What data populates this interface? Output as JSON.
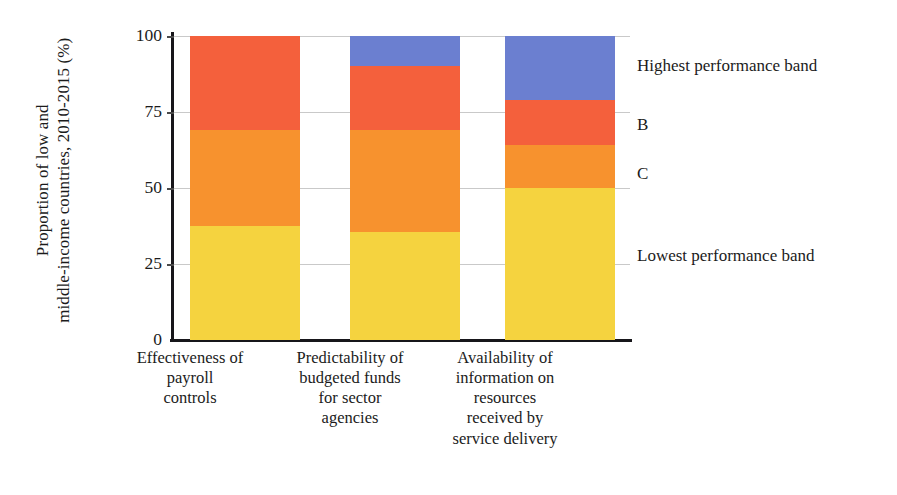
{
  "chart_data": {
    "type": "bar",
    "subtype": "stacked-vertical-100",
    "title": "",
    "xlabel": "",
    "ylabel": "Proportion of low and middle-income countries, 2010-2015 (%)",
    "ylim": [
      0,
      100
    ],
    "yticks": [
      0,
      25,
      50,
      75,
      100
    ],
    "ytick_labels": [
      "0",
      "25",
      "50",
      "75",
      "100"
    ],
    "grid": "horizontal",
    "legend_position": "right",
    "categories": [
      "Effectiveness of\npayroll\ncontrols",
      "Predictability of\nbudgeted funds\nfor sector\nagencies",
      "Availability of\ninformation on\nresources\nreceived by\nservice delivery"
    ],
    "series": [
      {
        "name": "Lowest performance band",
        "color": "#f5d33f",
        "values": [
          37.5,
          35.5,
          50
        ]
      },
      {
        "name": "C",
        "color": "#f7922e",
        "values": [
          31.5,
          33.5,
          14
        ]
      },
      {
        "name": "B",
        "color": "#f4603c",
        "values": [
          31,
          21,
          15
        ]
      },
      {
        "name": "Highest performance band",
        "color": "#6b7fd0",
        "values": [
          0,
          10,
          21
        ]
      }
    ],
    "legend_entries": [
      {
        "label": "Highest performance band",
        "color": "#6b7fd0"
      },
      {
        "label": "B",
        "color": "#f4603c"
      },
      {
        "label": "C",
        "color": "#f7922e"
      },
      {
        "label": "Lowest performance band",
        "color": "#f5d33f"
      }
    ]
  },
  "axis": {
    "y_title_line1": "Proportion of low and",
    "y_title_line2": "middle-income countries, 2010-2015 (%)",
    "tick_100": "100",
    "tick_75": "75",
    "tick_50": "50",
    "tick_25": "25",
    "tick_0": "0"
  },
  "categories": {
    "cat0": "Effectiveness of\npayroll\ncontrols",
    "cat1": "Predictability of\nbudgeted funds\nfor sector\nagencies",
    "cat2": "Availability of\ninformation on\nresources\nreceived by\nservice delivery"
  },
  "legend": {
    "highest": "Highest performance band",
    "b": "B",
    "c": "C",
    "lowest": "Lowest performance band"
  }
}
